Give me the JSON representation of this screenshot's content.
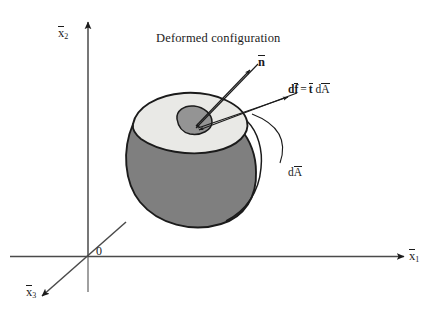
{
  "figure": {
    "type": "mechanics-continuum-diagram",
    "title_caption": "Deformed configuration",
    "background_color": "#ffffff",
    "line_color": "#1b1b1b"
  },
  "axes": {
    "vertical": {
      "name": "x2-axis",
      "symbol_base": "x",
      "symbol_sub": "2",
      "label": "x̅2",
      "overbar": true,
      "direction": "up",
      "arrowhead": true
    },
    "horizontal": {
      "name": "x1-axis",
      "symbol_base": "x",
      "symbol_sub": "1",
      "label": "x̅1",
      "overbar": true,
      "direction": "right",
      "arrowhead": true
    },
    "depth": {
      "name": "x3-axis",
      "symbol_base": "x",
      "symbol_sub": "3",
      "label": "x̅3",
      "overbar": true,
      "direction": "down-left",
      "arrowhead": true
    },
    "origin_label": "0"
  },
  "annotations": {
    "normal_vector": {
      "symbol_base": "n",
      "overbar": true,
      "bold": true,
      "label": "n̅",
      "description": "unit outward normal vector"
    },
    "force_relation": {
      "parts": {
        "d1": "d",
        "f": "f",
        "equals": "=",
        "t": "t",
        "d2": "d",
        "a": "A"
      },
      "label": "df̅ = t̅ dA̅",
      "description": "traction times area gives force increment"
    },
    "area_element": {
      "parts": {
        "d": "d",
        "a": "A"
      },
      "label": "dA̅",
      "description": "differential deformed area element"
    }
  },
  "body": {
    "name": "deformed-body",
    "top_face_color": "#e9e9e6",
    "side_face_color": "#7f7f7f",
    "patch_color": "#949494",
    "outline_color": "#1b1b1b"
  }
}
